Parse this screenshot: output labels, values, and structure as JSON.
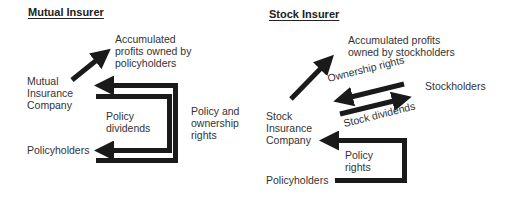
{
  "diagram": {
    "mutual": {
      "title": "Mutual Insurer",
      "profits_label_1": "Accumulated",
      "profits_label_2": "profits owned by",
      "profits_label_3": "policyholders",
      "company_label_1": "Mutual",
      "company_label_2": "Insurance",
      "company_label_3": "Company",
      "policyholders_label": "Policyholders",
      "dividends_label_1": "Policy",
      "dividends_label_2": "dividends",
      "rights_label_1": "Policy and",
      "rights_label_2": "ownership",
      "rights_label_3": "rights"
    },
    "stock": {
      "title": "Stock Insurer",
      "profits_label_1": "Accumulated profits",
      "profits_label_2": "owned by stockholders",
      "ownership_label": "Ownership rights",
      "stockholders_label": "Stockholders",
      "stock_dividends_label": "Stock dividends",
      "company_label_1": "Stock",
      "company_label_2": "Insurance",
      "company_label_3": "Company",
      "policy_rights_label_1": "Policy",
      "policy_rights_label_2": "rights",
      "policyholders_label": "Policyholders"
    },
    "colors": {
      "arrow": "#1a1a1a",
      "text": "#333333"
    }
  }
}
